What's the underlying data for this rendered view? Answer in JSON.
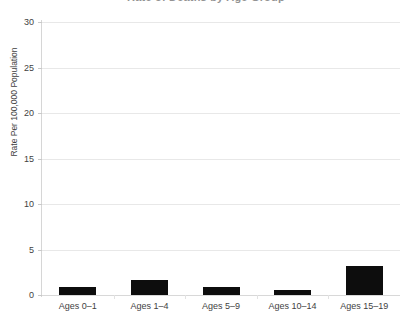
{
  "chart_data": {
    "type": "bar",
    "title": "Rate of Deaths by Age Group",
    "xlabel": "",
    "ylabel": "Rate Per 100,000 Population",
    "categories": [
      "Ages 0–1",
      "Ages 1–4",
      "Ages 5–9",
      "Ages 10–14",
      "Ages 15–19"
    ],
    "values": [
      0.9,
      1.6,
      0.9,
      0.6,
      3.2
    ],
    "ylim": [
      0,
      30
    ],
    "yticks": [
      0,
      5,
      10,
      15,
      20,
      25,
      30
    ],
    "ytick_labels": [
      "0",
      "5",
      "10",
      "15",
      "20",
      "25",
      "30"
    ],
    "grid": true,
    "legend": false,
    "bar_color": "#0d0d0d",
    "gridline_color": "#e8e8e8",
    "axis_text_color": "#3f3f3f"
  },
  "axis": {
    "y_title": "Rate Per 100,000 Population"
  },
  "title": {
    "text": "Rate of Deaths by Age Group"
  }
}
